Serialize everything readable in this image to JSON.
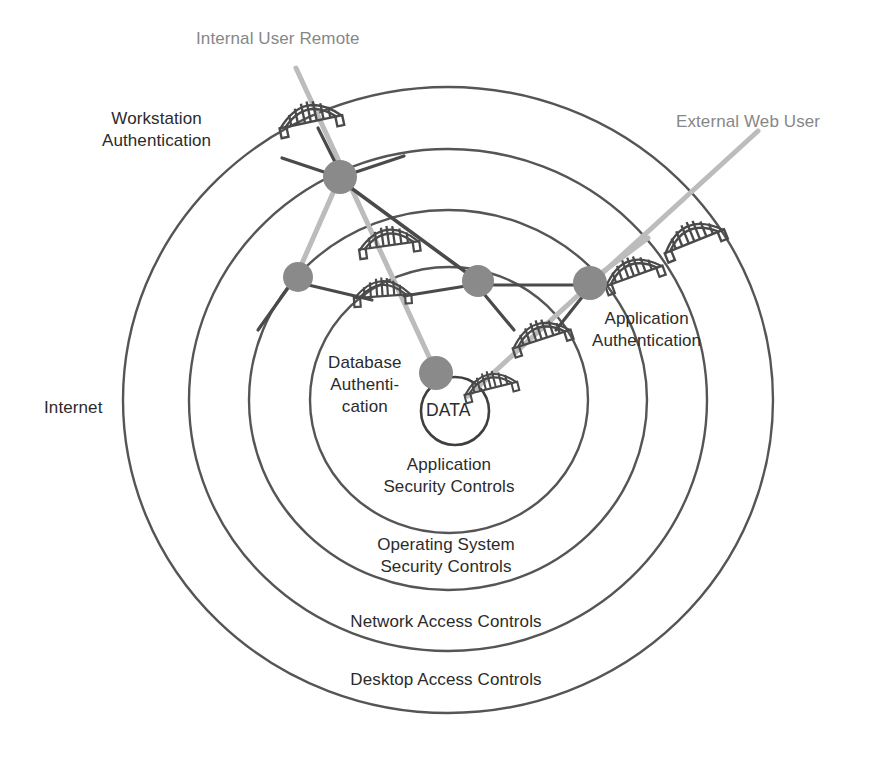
{
  "diagram": {
    "colors": {
      "ring_stroke": "#555555",
      "node_fill": "#8a8a8a",
      "dark_connector": "#4a4a4a",
      "light_connector": "#b9b9b9",
      "bridge_stroke": "#4a4a4a",
      "text": "#2b2b2b",
      "user_text": "#878787",
      "background": "#ffffff"
    },
    "center": {
      "label": "DATA",
      "cx": 455,
      "cy": 411,
      "r": 34
    },
    "rings": [
      {
        "id": "desktop-access-controls",
        "label": "Desktop Access Controls",
        "label_x": 446,
        "label_y": 678,
        "rx": 325,
        "ry": 313
      },
      {
        "id": "network-access-controls",
        "label": "Network Access Controls",
        "label_x": 446,
        "label_y": 621,
        "rx": 259,
        "ry": 251
      },
      {
        "id": "operating-system-security-controls",
        "label": "Operating System\nSecurity Controls",
        "label_x": 446,
        "label_y": 546,
        "rx": 199,
        "ry": 190
      },
      {
        "id": "application-security-controls",
        "label": "Application\nSecurity Controls",
        "label_x": 448,
        "label_y": 455,
        "rx": 139,
        "ry": 133
      }
    ],
    "external_labels": [
      {
        "id": "internet",
        "label": "Internet",
        "x": 44,
        "y": 400
      },
      {
        "id": "workstation-authentication",
        "label": "Workstation\nAuthentication",
        "x": 102,
        "y": 110
      },
      {
        "id": "database-authentication",
        "label": "Database\nAuthenti-\ncation",
        "x": 330,
        "y": 352
      },
      {
        "id": "application-authentication",
        "label": "Application\nAuthentication",
        "x": 592,
        "y": 310
      }
    ],
    "users": [
      {
        "id": "internal-user-remote",
        "label": "Internal User Remote",
        "label_x": 196,
        "label_y": 28,
        "path_start": {
          "x": 296,
          "y": 68
        },
        "path_end": {
          "x": 437,
          "y": 374
        }
      },
      {
        "id": "external-web-user",
        "label": "External Web User",
        "label_x": 676,
        "label_y": 111,
        "path_start": {
          "x": 758,
          "y": 131
        },
        "path_end": {
          "x": 466,
          "y": 395
        }
      }
    ],
    "nodes": [
      {
        "id": "node-workstation",
        "cx": 340,
        "cy": 177,
        "r": 17
      },
      {
        "id": "node-internal-os",
        "cx": 298,
        "cy": 277,
        "r": 15
      },
      {
        "id": "node-internal-app",
        "cx": 478,
        "cy": 281,
        "r": 16
      },
      {
        "id": "node-external-app",
        "cx": 590,
        "cy": 283,
        "r": 17
      },
      {
        "id": "node-database",
        "cx": 436,
        "cy": 373,
        "r": 17
      }
    ],
    "gateways": [
      {
        "id": "gateway-internal-desktop",
        "cx": 309,
        "cy": 113,
        "scale": 1.0,
        "rotate": -12
      },
      {
        "id": "gateway-internal-network",
        "cx": 388,
        "cy": 237,
        "scale": 0.95,
        "rotate": -8
      },
      {
        "id": "gateway-internal-os",
        "cx": 382,
        "cy": 288,
        "scale": 0.9,
        "rotate": -4
      },
      {
        "id": "gateway-external-desktop",
        "cx": 691,
        "cy": 233,
        "scale": 1.0,
        "rotate": -22
      },
      {
        "id": "gateway-external-network",
        "cx": 631,
        "cy": 268,
        "scale": 0.95,
        "rotate": -20
      },
      {
        "id": "gateway-external-os",
        "cx": 539,
        "cy": 331,
        "scale": 0.95,
        "rotate": -18
      },
      {
        "id": "gateway-external-app",
        "cx": 489,
        "cy": 381,
        "scale": 0.85,
        "rotate": -14
      }
    ],
    "connectors": [
      {
        "id": "conn-workstation-to-os",
        "from": {
          "x": 340,
          "y": 177
        },
        "to": {
          "x": 298,
          "y": 277
        },
        "tone": "light"
      },
      {
        "id": "conn-workstation-to-database",
        "from": {
          "x": 340,
          "y": 177
        },
        "to": {
          "x": 436,
          "y": 373
        },
        "tone": "light"
      },
      {
        "id": "conn-workstation-to-app",
        "from": {
          "x": 340,
          "y": 177
        },
        "to": {
          "x": 478,
          "y": 281
        },
        "tone": "dark"
      },
      {
        "id": "conn-os-to-gatewayos",
        "from": {
          "x": 298,
          "y": 277
        },
        "to": {
          "x": 360,
          "y": 288
        },
        "tone": "dark"
      },
      {
        "id": "conn-app-to-external",
        "from": {
          "x": 478,
          "y": 281
        },
        "to": {
          "x": 590,
          "y": 283
        },
        "tone": "light"
      },
      {
        "id": "conn-external-to-gateway",
        "from": {
          "x": 590,
          "y": 283
        },
        "to": {
          "x": 660,
          "y": 232
        },
        "tone": "light"
      }
    ]
  }
}
